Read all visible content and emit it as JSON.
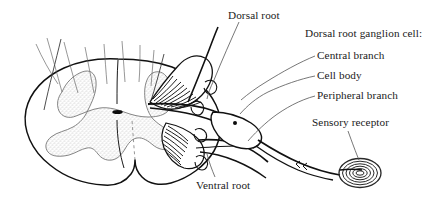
{
  "figure": {
    "colors": {
      "ink": "#111111",
      "text": "#1a1a1a",
      "thin_line": "#555555",
      "gray_matter_fill": "#e8e8e8",
      "gray_matter_stipple": "#9a9a9a",
      "background": "#ffffff"
    }
  },
  "labels": {
    "dorsal_root": "Dorsal root",
    "drg_title": "Dorsal root ganglion cell:",
    "central_branch": "Central branch",
    "cell_body": "Cell body",
    "peripheral_branch": "Peripheral branch",
    "sensory_receptor": "Sensory receptor",
    "ventral_root": "Ventral root"
  },
  "structures": {
    "spinal_cord": "spinal-cord-cross-section",
    "gray_matter": "butterfly-gray-matter",
    "central_canal": "central-canal",
    "dorsal_rootlets": "dorsal-rootlets-bundle",
    "ventral_rootlets": "ventral-rootlets-bundle",
    "ganglion": "dorsal-root-ganglion",
    "ganglion_cell_body_dot": "ganglion-cell-body",
    "nerve_fiber": "peripheral-nerve-fiber",
    "nerve_node": "node-of-ranvier",
    "receptor_corpuscle": "lamellated-sensory-corpuscle"
  }
}
